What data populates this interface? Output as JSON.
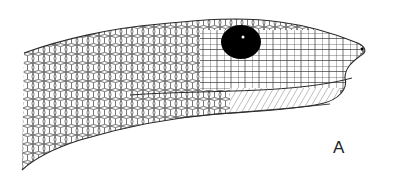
{
  "figure": {
    "panel_label": "A",
    "colors": {
      "line": "#2a2a2a",
      "eye": "#000000",
      "background": "#ffffff"
    }
  }
}
